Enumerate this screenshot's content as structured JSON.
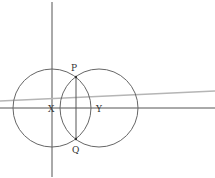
{
  "diagram": {
    "labels": {
      "P": "P",
      "Q": "Q",
      "X": "X",
      "Y": "Y"
    },
    "colors": {
      "stroke": "#555555",
      "slanted_line": "#b5b5b5",
      "background": "#ffffff"
    }
  }
}
